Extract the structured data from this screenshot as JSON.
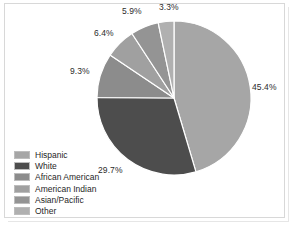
{
  "chart_data": {
    "type": "pie",
    "title": "",
    "subtitle": "",
    "xlabel": "",
    "ylabel": "",
    "grid": false,
    "legend_position": "bottom-left",
    "start_angle_deg": 0,
    "direction": "clockwise",
    "center": {
      "x": 174,
      "y": 98
    },
    "radius": 77,
    "separator_color": "#ffffff",
    "categories": [
      "Hispanic",
      "White",
      "African American",
      "American Indian",
      "Asian/Pacific",
      "Other"
    ],
    "values": [
      45.4,
      29.7,
      9.3,
      6.4,
      5.9,
      3.3
    ],
    "value_unit": "%",
    "slices": [
      {
        "label": "Hispanic",
        "value": 45.4,
        "display": "45.4%",
        "color": "#a6a6a6",
        "label_x": 252,
        "label_y": 82
      },
      {
        "label": "White",
        "value": 29.7,
        "display": "29.7%",
        "color": "#4d4d4d",
        "label_x": 98,
        "label_y": 165
      },
      {
        "label": "African American",
        "value": 9.3,
        "display": "9.3%",
        "color": "#8c8c8c",
        "label_x": 70,
        "label_y": 66
      },
      {
        "label": "American Indian",
        "value": 6.4,
        "display": "6.4%",
        "color": "#a0a0a0",
        "label_x": 94,
        "label_y": 28
      },
      {
        "label": "Asian/Pacific",
        "value": 5.9,
        "display": "5.9%",
        "color": "#949494",
        "label_x": 122,
        "label_y": 6
      },
      {
        "label": "Other",
        "value": 3.3,
        "display": "3.3%",
        "color": "#b0b0b0",
        "label_x": 159,
        "label_y": 2
      }
    ]
  },
  "legend": {
    "items": [
      {
        "label": "Hispanic",
        "color": "#a6a6a6"
      },
      {
        "label": "White",
        "color": "#4d4d4d"
      },
      {
        "label": "African American",
        "color": "#8c8c8c"
      },
      {
        "label": "American Indian",
        "color": "#a0a0a0"
      },
      {
        "label": "Asian/Pacific",
        "color": "#949494"
      },
      {
        "label": "Other",
        "color": "#b0b0b0"
      }
    ]
  },
  "colors": {
    "background": "#ffffff",
    "frame_border": "#d8d8d8",
    "text": "#2b2b2b"
  }
}
